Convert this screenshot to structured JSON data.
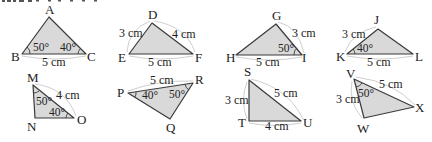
{
  "figure": {
    "type": "triangle-congruence-exercise",
    "partial_top_text": "",
    "triangles": [
      {
        "id": "ABC",
        "vertices": {
          "A": "A",
          "B": "B",
          "C": "C"
        },
        "given": {
          "angle_B": "50°",
          "angle_C": "40°",
          "side_BC": "5 cm"
        }
      },
      {
        "id": "DEF",
        "vertices": {
          "D": "D",
          "E": "E",
          "F": "F"
        },
        "given": {
          "side_DE": "3 cm",
          "side_DF": "4 cm",
          "side_EF": "5 cm"
        }
      },
      {
        "id": "GHI",
        "vertices": {
          "G": "G",
          "H": "H",
          "I": "I"
        },
        "given": {
          "side_GI": "3 cm",
          "angle_I": "50°",
          "side_HI": "5 cm"
        }
      },
      {
        "id": "JKL",
        "vertices": {
          "J": "J",
          "K": "K",
          "L": "L"
        },
        "given": {
          "side_JK": "3 cm",
          "angle_K": "40°",
          "side_KL": "5 cm"
        }
      },
      {
        "id": "MNO",
        "vertices": {
          "M": "M",
          "N": "N",
          "O": "O"
        },
        "given": {
          "side_MO": "4 cm",
          "angle_M": "50°",
          "angle_O": "40°"
        }
      },
      {
        "id": "PQR",
        "vertices": {
          "P": "P",
          "Q": "Q",
          "R": "R"
        },
        "given": {
          "side_PR": "5 cm",
          "angle_P": "40°",
          "angle_R": "50°"
        }
      },
      {
        "id": "STU",
        "vertices": {
          "S": "S",
          "T": "T",
          "U": "U"
        },
        "given": {
          "side_ST": "3 cm",
          "side_SU": "5 cm",
          "side_TU": "4 cm"
        }
      },
      {
        "id": "VWX",
        "vertices": {
          "V": "V",
          "W": "W",
          "X": "X"
        },
        "given": {
          "side_VW": "3 cm",
          "side_VX": "5 cm",
          "angle_V": "50°"
        }
      }
    ]
  },
  "colors": {
    "fill": "#d9d9d9",
    "stroke": "#3a3a3a",
    "measure_arc": "#cfcfcf"
  }
}
